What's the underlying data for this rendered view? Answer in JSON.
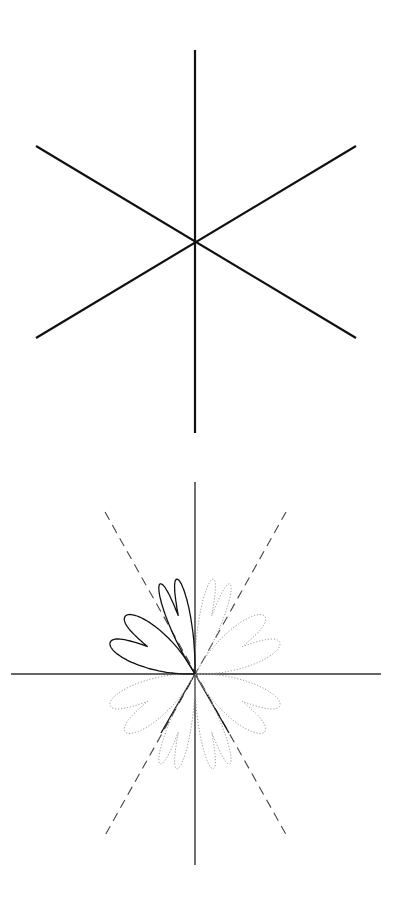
{
  "figures": [
    {
      "id": "six-ray-star",
      "description": "Six rays through a common center at 60 degree spacing",
      "center": [
        195,
        242
      ],
      "stroke_color": "#111111",
      "lines": [
        {
          "from": [
            195,
            50
          ],
          "to": [
            195,
            433
          ]
        },
        {
          "from": [
            36,
            146
          ],
          "to": [
            356,
            338
          ]
        },
        {
          "from": [
            36,
            338
          ],
          "to": [
            356,
            146
          ]
        }
      ]
    },
    {
      "id": "heart-lobe-rosette",
      "description": "Axes with dashed 60/120 degree lines and heart-shaped lobes; upper-left lobes solid, remaining lobes dotted",
      "origin": [
        195,
        674
      ],
      "axis_color": "#333333",
      "solid_color": "#111111",
      "dotted_color": "#999999",
      "dashed_color": "#444444",
      "axes": {
        "vertical": {
          "from": [
            195,
            482
          ],
          "to": [
            195,
            865
          ]
        },
        "horizontal": {
          "from": [
            11,
            674
          ],
          "to": [
            381,
            674
          ]
        }
      },
      "dashed_lines": [
        {
          "from": [
            105,
            512
          ],
          "to": [
            288,
            838
          ]
        },
        {
          "from": [
            286,
            512
          ],
          "to": [
            103,
            839
          ]
        }
      ],
      "solid_segments": [
        {
          "from": [
            195,
            674
          ],
          "to": [
            161,
            733
          ]
        },
        {
          "from": [
            195,
            674
          ],
          "to": [
            229,
            733
          ]
        }
      ]
    }
  ]
}
